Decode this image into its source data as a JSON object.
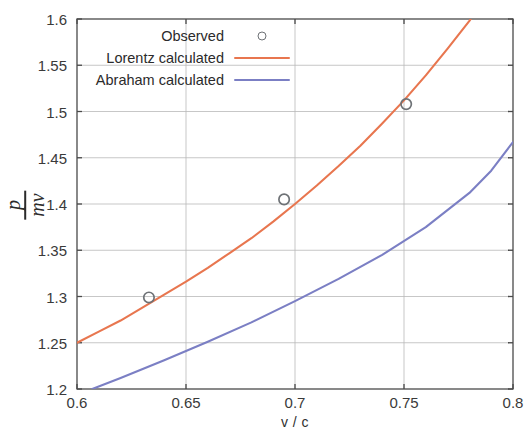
{
  "chart_data": {
    "type": "line",
    "title": "",
    "xlabel": "v / c",
    "ylabel": "p / mv",
    "ylabel_numerator": "p",
    "ylabel_denominator": "mv",
    "xlim": [
      0.6,
      0.8
    ],
    "ylim": [
      1.2,
      1.6
    ],
    "xticks": [
      "0.6",
      "0.65",
      "0.7",
      "0.75",
      "0.8"
    ],
    "xtick_values": [
      0.6,
      0.65,
      0.7,
      0.75,
      0.8
    ],
    "yticks": [
      "1.2",
      "1.25",
      "1.3",
      "1.35",
      "1.4",
      "1.45",
      "1.5",
      "1.55",
      "1.6"
    ],
    "ytick_values": [
      1.2,
      1.25,
      1.3,
      1.35,
      1.4,
      1.45,
      1.5,
      1.55,
      1.6
    ],
    "grid": true,
    "legend_position": "top-center",
    "series": [
      {
        "name": "Observed",
        "kind": "scatter",
        "marker": "open-circle",
        "color": "#6e7276",
        "points": [
          {
            "x": 0.633,
            "y": 1.299
          },
          {
            "x": 0.695,
            "y": 1.405
          },
          {
            "x": 0.751,
            "y": 1.508
          }
        ]
      },
      {
        "name": "Lorentz calculated",
        "kind": "line",
        "color": "#e8764f",
        "points": [
          {
            "x": 0.6,
            "y": 1.25
          },
          {
            "x": 0.61,
            "y": 1.262
          },
          {
            "x": 0.62,
            "y": 1.274
          },
          {
            "x": 0.63,
            "y": 1.288
          },
          {
            "x": 0.64,
            "y": 1.302
          },
          {
            "x": 0.65,
            "y": 1.316
          },
          {
            "x": 0.66,
            "y": 1.331
          },
          {
            "x": 0.67,
            "y": 1.347
          },
          {
            "x": 0.68,
            "y": 1.363
          },
          {
            "x": 0.69,
            "y": 1.381
          },
          {
            "x": 0.7,
            "y": 1.4
          },
          {
            "x": 0.71,
            "y": 1.42
          },
          {
            "x": 0.72,
            "y": 1.441
          },
          {
            "x": 0.73,
            "y": 1.463
          },
          {
            "x": 0.74,
            "y": 1.487
          },
          {
            "x": 0.75,
            "y": 1.512
          },
          {
            "x": 0.76,
            "y": 1.539
          },
          {
            "x": 0.77,
            "y": 1.568
          },
          {
            "x": 0.78,
            "y": 1.598
          },
          {
            "x": 0.782,
            "y": 1.605
          }
        ]
      },
      {
        "name": "Abraham calculated",
        "kind": "line",
        "color": "#7b7fc4",
        "points": [
          {
            "x": 0.607,
            "y": 1.2
          },
          {
            "x": 0.62,
            "y": 1.212
          },
          {
            "x": 0.64,
            "y": 1.231
          },
          {
            "x": 0.66,
            "y": 1.251
          },
          {
            "x": 0.68,
            "y": 1.272
          },
          {
            "x": 0.7,
            "y": 1.295
          },
          {
            "x": 0.72,
            "y": 1.319
          },
          {
            "x": 0.74,
            "y": 1.345
          },
          {
            "x": 0.76,
            "y": 1.375
          },
          {
            "x": 0.78,
            "y": 1.412
          },
          {
            "x": 0.79,
            "y": 1.436
          },
          {
            "x": 0.8,
            "y": 1.467
          }
        ]
      }
    ]
  },
  "legend": {
    "entries": [
      {
        "label": "Observed",
        "style": "marker",
        "color": "#6e7276"
      },
      {
        "label": "Lorentz calculated",
        "style": "line",
        "color": "#e8764f"
      },
      {
        "label": "Abraham calculated",
        "style": "line",
        "color": "#7b7fc4"
      }
    ]
  },
  "colors": {
    "lorentz": "#e8764f",
    "abraham": "#7b7fc4",
    "marker": "#6e7276",
    "axis": "#4a4a4a",
    "grid": "#b9b9b9",
    "text": "#2b2b2b",
    "background": "#ffffff"
  }
}
